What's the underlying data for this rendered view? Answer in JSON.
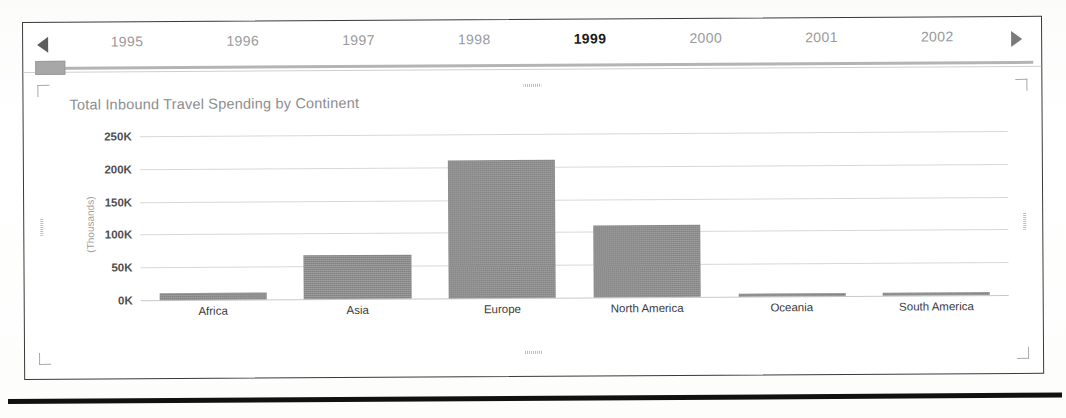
{
  "timeline": {
    "prev_arrow_icon": "triangle-left-icon",
    "next_arrow_icon": "triangle-right-icon",
    "selected_year": "1999",
    "years": [
      "1995",
      "1996",
      "1997",
      "1998",
      "1999",
      "2000",
      "2001",
      "2002"
    ],
    "thumb_label": "slider-thumb"
  },
  "chart": {
    "title": "Total Inbound Travel Spending by Continent"
  },
  "chart_data": {
    "type": "bar",
    "title": "Total Inbound Travel Spending by Continent",
    "xlabel": "",
    "ylabel": "(Thousands)",
    "categories": [
      "Africa",
      "Asia",
      "Europe",
      "North America",
      "Oceania",
      "South America"
    ],
    "values": [
      11,
      67,
      210,
      110,
      5,
      4
    ],
    "ytick_labels": [
      "0K",
      "50K",
      "100K",
      "150K",
      "200K",
      "250K"
    ],
    "ytick_values": [
      0,
      50,
      100,
      150,
      200,
      250
    ],
    "ylim": [
      0,
      265
    ],
    "grid": true,
    "legend": "none",
    "bar_color": "#8a8a8a",
    "series": [
      {
        "name": "Total Inbound Travel Spending",
        "values": [
          11,
          67,
          210,
          110,
          5,
          4
        ]
      }
    ]
  },
  "handles": {
    "top_left": "resize-handle-top-left",
    "top_right": "resize-handle-top-right",
    "bottom_left": "resize-handle-bottom-left",
    "bottom_right": "resize-handle-bottom-right",
    "top_middle": "resize-handle-top-middle",
    "bottom_middle": "resize-handle-bottom-middle",
    "left_middle": "resize-handle-left-middle",
    "right_middle": "resize-handle-right-middle"
  },
  "colors": {
    "bar": "#8a8a8a",
    "frame": "#3a3a3a",
    "grid": "#d8d8d8",
    "year_inactive": "#9a9a9a",
    "year_active": "#1d1d1d"
  }
}
